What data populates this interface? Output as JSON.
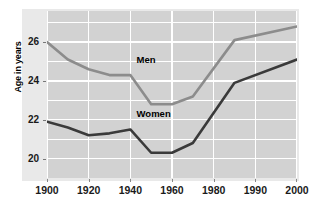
{
  "chart_data": {
    "type": "line",
    "title": "",
    "subtitle": "",
    "xlabel": "",
    "ylabel": "Age in years",
    "xlim": [
      1900,
      2000
    ],
    "ylim": [
      19,
      27.6
    ],
    "grid": true,
    "grid_color": "#ffffff",
    "plot_background": "#d2d2d2",
    "panel_background": "#e9e9e9",
    "legend_position": "inline-annotations",
    "x_tick_labels": [
      "1900",
      "1920",
      "1940",
      "1960",
      "1980",
      "1990",
      "2000"
    ],
    "x_tick_values": [
      1900,
      1920,
      1940,
      1960,
      1980,
      1990,
      2000
    ],
    "y_tick_labels": [
      "26",
      "24",
      "22",
      "20"
    ],
    "y_tick_values": [
      26,
      24,
      22,
      20
    ],
    "series": [
      {
        "name": "Men",
        "color": "#8c8c8c",
        "label_text": "Men",
        "x": [
          1900,
          1910,
          1920,
          1930,
          1940,
          1950,
          1960,
          1970,
          1985,
          2000
        ],
        "values": [
          26.0,
          25.1,
          24.6,
          24.3,
          24.3,
          22.8,
          22.8,
          23.2,
          26.1,
          26.8
        ]
      },
      {
        "name": "Women",
        "color": "#3a3a3a",
        "label_text": "Women",
        "x": [
          1900,
          1910,
          1920,
          1930,
          1940,
          1950,
          1960,
          1970,
          1985,
          2000
        ],
        "values": [
          21.9,
          21.6,
          21.2,
          21.3,
          21.5,
          20.3,
          20.3,
          20.8,
          23.9,
          25.1
        ]
      }
    ],
    "annotations": [
      {
        "text": "Men",
        "x": 1943,
        "y": 25.1
      },
      {
        "text": "Women",
        "x": 1943,
        "y": 22.3
      }
    ]
  }
}
